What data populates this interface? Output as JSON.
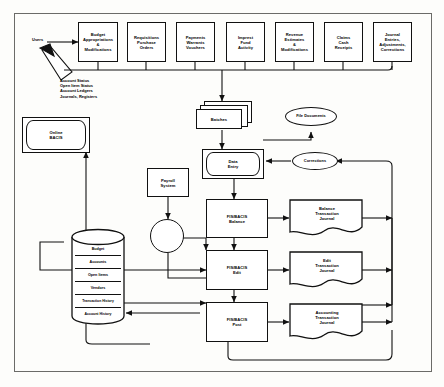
{
  "diagram": {
    "actor": {
      "label": "Users"
    },
    "inputs": [
      {
        "id": "budget",
        "label": "Budget\nAppropriations\n&\nModifications"
      },
      {
        "id": "requisitions",
        "label": "Requisitions\nPurchase\nOrders"
      },
      {
        "id": "payments",
        "label": "Payments\nWarrants\nVouchers"
      },
      {
        "id": "imprest",
        "label": "Imprest\nFund\nActivity"
      },
      {
        "id": "revenue",
        "label": "Revenue\nEstimates\n&\nModifications"
      },
      {
        "id": "claims",
        "label": "Claims\nCash\nReceipts"
      },
      {
        "id": "journal",
        "label": "Journal\nEntries,\nAdjustments,\nCorrections"
      }
    ],
    "online_system": {
      "label": "Online\nBACIS"
    },
    "online_outputs_note": "Account Status\nOpen Item Status\nAccount Ledgers\nJournals, Registers",
    "batches": {
      "label": "Batches"
    },
    "file_documents": {
      "label": "File Documents"
    },
    "data_entry": {
      "label": "Data\nEntry"
    },
    "corrections": {
      "label": "Corrections"
    },
    "payroll": {
      "label": "Payroll\nSystem"
    },
    "connector": {
      "label": ""
    },
    "processes": [
      {
        "id": "balance",
        "label": "FIS/BACIS\nBalance"
      },
      {
        "id": "edit",
        "label": "FIS/BACIS\nEdit"
      },
      {
        "id": "post",
        "label": "FIS/BACIS\nPost"
      }
    ],
    "journals": [
      {
        "id": "balance-journal",
        "label": "Balance\nTransaction\nJournal"
      },
      {
        "id": "edit-journal",
        "label": "Edit\nTransaction\nJournal"
      },
      {
        "id": "accounting-journal",
        "label": "Accounting\nTransaction\nJournal"
      }
    ],
    "database": {
      "name": "BACIS Database",
      "stores": [
        {
          "label": "Budget"
        },
        {
          "label": "Accounts"
        },
        {
          "label": "Open Items"
        },
        {
          "label": "Vendors"
        },
        {
          "label": "Transaction History"
        },
        {
          "label": "Account History"
        }
      ]
    },
    "colors": {
      "line": "#111111",
      "frame": "#6b6b68",
      "background": "#fdfdfb"
    }
  }
}
